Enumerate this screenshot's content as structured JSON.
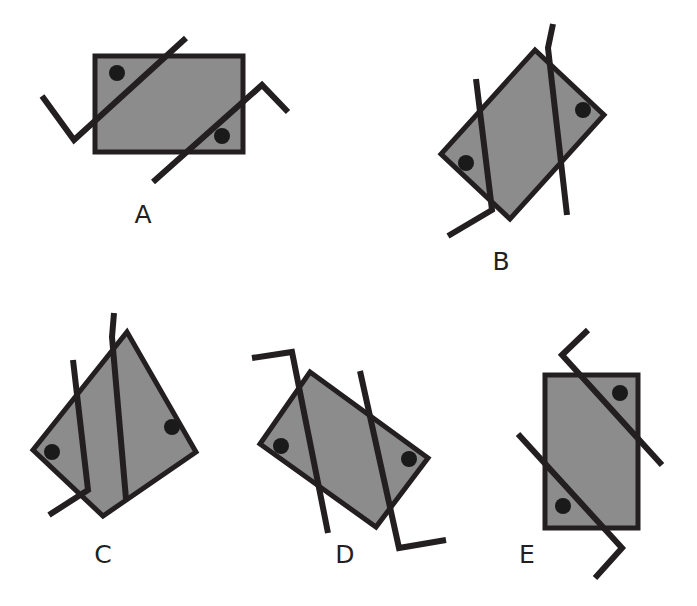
{
  "page": {
    "kind": "figure-sheet",
    "background_color": "#ffffff",
    "width": 697,
    "height": 606
  },
  "style": {
    "shape_fill": "#8c8c8c",
    "shape_stroke": "#231f20",
    "shape_stroke_width": 5,
    "line_color": "#231f20",
    "line_width": 6,
    "dot_color": "#1a1a1a",
    "dot_radius": 8,
    "label_color": "#231f20",
    "label_font_size": 25
  },
  "figures": [
    {
      "id": "A",
      "label": "A",
      "label_x": 143,
      "label_y": 223,
      "rect_points": "95,56 243,56 243,152 95,152",
      "dots": [
        {
          "cx": 117,
          "cy": 73
        },
        {
          "cx": 222,
          "cy": 136
        }
      ],
      "lines": [
        {
          "name": "stroke-1",
          "points": "42,96 74,140 186,38"
        },
        {
          "name": "stroke-2",
          "points": "153,182 262,85 288,112"
        }
      ]
    },
    {
      "id": "B",
      "label": "B",
      "label_x": 501,
      "label_y": 270,
      "rect_points": "535,50 604,115 510,219 441,154",
      "dots": [
        {
          "cx": 583,
          "cy": 110
        },
        {
          "cx": 466,
          "cy": 163
        }
      ],
      "lines": [
        {
          "name": "stroke-1",
          "points": "476,79 492,210 448,236"
        },
        {
          "name": "stroke-2",
          "points": "553,24 548,48 567,215"
        }
      ]
    },
    {
      "id": "C",
      "label": "C",
      "label_x": 103,
      "label_y": 563,
      "rect_points": "127,332 196,452 103,516 33,450"
    },
    {
      "id": "D",
      "label": "D",
      "label_x": 345,
      "label_y": 563,
      "rect_points": "310,372 428,458 376,527 260,444"
    },
    {
      "id": "E",
      "label": "E",
      "label_x": 527,
      "label_y": 563,
      "rect_points": "545,375 638,375 638,528 545,528"
    }
  ],
  "figure_c": {
    "rect_points": "127,332 196,452 103,516 33,450",
    "dots": [
      {
        "cx": 172,
        "cy": 427
      },
      {
        "cx": 52,
        "cy": 452
      }
    ],
    "lines": [
      {
        "name": "stroke-1",
        "points": "73,360 88,490 49,515"
      },
      {
        "name": "stroke-2",
        "points": "114,313 112,337 126,499"
      }
    ]
  },
  "figure_d": {
    "rect_points": "310,372 428,458 376,527 260,444",
    "dots": [
      {
        "cx": 281,
        "cy": 446
      },
      {
        "cx": 409,
        "cy": 459
      }
    ],
    "lines": [
      {
        "name": "stroke-1",
        "points": "252,358 292,352 328,533"
      },
      {
        "name": "stroke-2",
        "points": "360,371 399,548 446,540"
      }
    ]
  },
  "figure_e": {
    "rect_points": "545,375 638,375 638,528 545,528",
    "dots": [
      {
        "cx": 620,
        "cy": 393
      },
      {
        "cx": 563,
        "cy": 506
      }
    ],
    "lines": [
      {
        "name": "stroke-1",
        "points": "588,330 562,355 662,465"
      },
      {
        "name": "stroke-2",
        "points": "518,434 622,548 595,578"
      }
    ]
  },
  "labels": {
    "a": "A",
    "b": "B",
    "c": "C",
    "d": "D",
    "e": "E"
  }
}
